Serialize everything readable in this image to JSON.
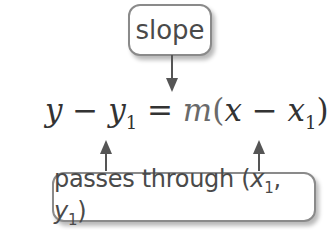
{
  "diagram": {
    "top_label": "slope",
    "bottom_label": {
      "text": "passes through",
      "point": {
        "x": "x",
        "x_sub": "1",
        "sep": ", ",
        "y": "y",
        "y_sub": "1"
      }
    },
    "equation": {
      "lhs_var": "y",
      "minus1": " − ",
      "lhs_var2": "y",
      "lhs_sub": "1",
      "equals": " = ",
      "slope_symbol": "m",
      "open_paren": "(",
      "rhs_var": "x",
      "minus2": " − ",
      "rhs_var2": "x",
      "rhs_sub": "1",
      "close_paren": ")"
    },
    "arrows": [
      {
        "from": "slope",
        "to": "m",
        "direction": "down"
      },
      {
        "from": "passes through",
        "to": "y1",
        "direction": "up"
      },
      {
        "from": "passes through",
        "to": "x1",
        "direction": "up"
      }
    ],
    "colors": {
      "box_border": "#8a8a8a",
      "text": "#4a4a4a",
      "arrow": "#555555"
    }
  }
}
